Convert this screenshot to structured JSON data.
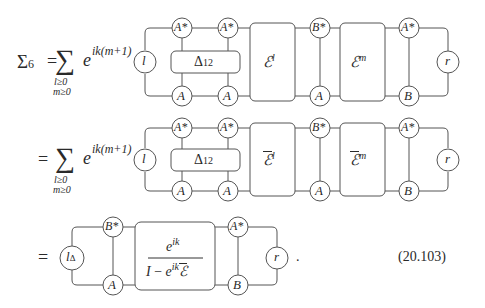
{
  "equation": {
    "number": "(20.103)",
    "lhs": "Σ",
    "lhs_subscript": "6",
    "equals": "=",
    "sum_symbol": "∑",
    "sum_exponent": "ik(m+1)",
    "sum_base": "e",
    "sum_limits": [
      "l≥0",
      "m≥0"
    ],
    "trailing_period": "."
  },
  "rows": [
    {
      "id": "row1",
      "left_node": "l",
      "top_nodes": [
        "A*",
        "A*",
        "B*",
        "A*"
      ],
      "bottom_nodes": [
        "A",
        "A",
        "A",
        "B"
      ],
      "inner_box": {
        "base": "Δ",
        "sub": "12"
      },
      "blocks": [
        {
          "base": "ℰ",
          "sup": "l",
          "bar": false
        },
        {
          "base": "ℰ",
          "sup": "m",
          "bar": false
        }
      ],
      "right_node": "r"
    },
    {
      "id": "row2",
      "left_node": "l",
      "top_nodes": [
        "A*",
        "A*",
        "B*",
        "A*"
      ],
      "bottom_nodes": [
        "A",
        "A",
        "A",
        "B"
      ],
      "inner_box": {
        "base": "Δ",
        "sub": "12"
      },
      "blocks": [
        {
          "base": "ℰ",
          "sup": "l",
          "bar": true
        },
        {
          "base": "ℰ",
          "sup": "m",
          "bar": true
        }
      ],
      "right_node": "r"
    },
    {
      "id": "row3",
      "left_node": {
        "base": "l",
        "sub": "Δ"
      },
      "top_nodes": [
        "B*",
        "A*"
      ],
      "bottom_nodes": [
        "A",
        "B"
      ],
      "fraction": {
        "numerator": {
          "base": "e",
          "sup": "ik"
        },
        "denominator": {
          "identity": "I",
          "minus": "−",
          "base": "e",
          "sup": "ik",
          "operator": "ℰ",
          "bar": true
        }
      },
      "right_node": "r"
    }
  ]
}
